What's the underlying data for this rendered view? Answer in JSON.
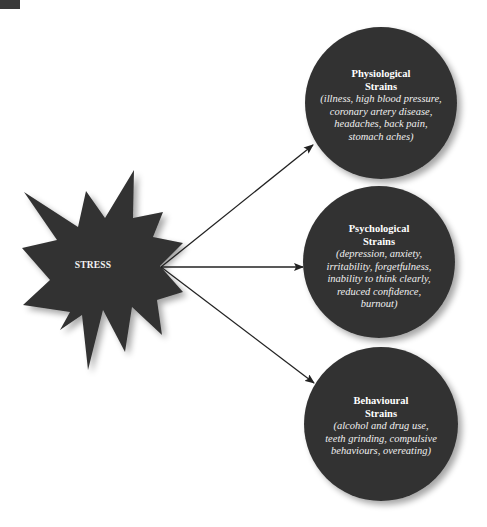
{
  "diagram": {
    "source": {
      "label": "STRESS",
      "shape": "starburst",
      "color": "#333333"
    },
    "targets": [
      {
        "title_line1": "Physiological",
        "title_line2": "Strains",
        "desc_lines": [
          "(illness, high blood pressure,",
          "coronary artery disease,",
          "headaches, back pain,",
          "stomach aches)"
        ],
        "color": "#333333"
      },
      {
        "title_line1": "Psychological",
        "title_line2": "Strains",
        "desc_lines": [
          "(depression, anxiety,",
          "irritability, forgetfulness,",
          "inability to think clearly,",
          "reduced confidence,",
          "burnout)"
        ],
        "color": "#333333"
      },
      {
        "title_line1": "Behavioural",
        "title_line2": "Strains",
        "desc_lines": [
          "(alcohol and drug use,",
          "teeth grinding, compulsive",
          "behaviours, overeating)"
        ],
        "color": "#333333"
      }
    ],
    "arrows": [
      {
        "from": "STRESS",
        "to": "Physiological Strains"
      },
      {
        "from": "STRESS",
        "to": "Psychological Strains"
      },
      {
        "from": "STRESS",
        "to": "Behavioural Strains"
      }
    ],
    "colors": {
      "shape_fill": "#333333",
      "arrow": "#222222",
      "text": "#ffffff",
      "background": "#ffffff"
    }
  }
}
